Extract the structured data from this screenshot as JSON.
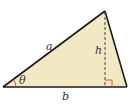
{
  "diagram": {
    "type": "triangle-area",
    "labels": {
      "side_a": "a",
      "side_b": "b",
      "height": "h",
      "angle": "θ"
    },
    "colors": {
      "fill": "#f3e8c4",
      "stroke": "#1a1a1a",
      "angle_arc": "#c0504d",
      "right_angle": "#c0504d"
    }
  }
}
